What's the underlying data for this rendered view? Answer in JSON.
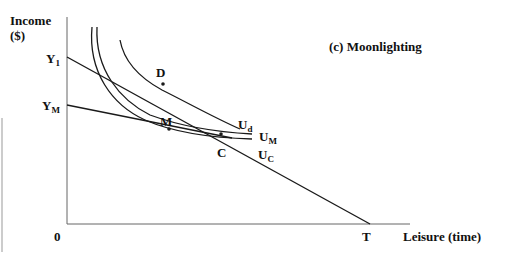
{
  "title": "(c) Moonlighting",
  "axes": {
    "y_label_line1": "Income",
    "y_label_line2": "($)",
    "x_label": "Leisure (time)",
    "origin": "0"
  },
  "intercepts": {
    "y1_main": "Y",
    "y1_sub": "1",
    "ym_main": "Y",
    "ym_sub": "M",
    "t": "T"
  },
  "points": {
    "d": "D",
    "m": "M",
    "c": "C"
  },
  "curves": {
    "ud_main": "U",
    "ud_sub": "d",
    "um_main": "U",
    "um_sub": "M",
    "uc_main": "U",
    "uc_sub": "C"
  },
  "colors": {
    "line": "#1a1a1a",
    "axis": "#555555",
    "background": "#ffffff"
  }
}
